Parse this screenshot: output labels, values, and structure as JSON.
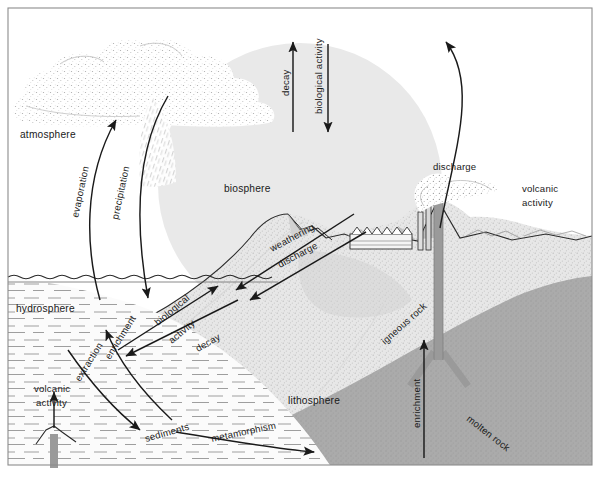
{
  "diagram": {
    "type": "scientific-schematic",
    "canvas": {
      "width": 600,
      "height": 479
    },
    "frame": {
      "stroke": "#8c8c8c",
      "inset_left": 8,
      "inset_top": 8,
      "inset_right": 8,
      "inset_bottom": 14
    }
  },
  "spheres": {
    "atmosphere": {
      "label": "atmosphere",
      "x": 20,
      "y": 134
    },
    "biosphere": {
      "label": "biosphere",
      "x": 223,
      "y": 188,
      "shape": "circle",
      "cx": 300,
      "cy": 185,
      "r": 142,
      "fill": "#e9e9e9"
    },
    "hydrosphere": {
      "label": "hydrosphere",
      "x": 16,
      "y": 308,
      "fill": "#f2f2f2"
    },
    "lithosphere": {
      "label": "lithosphere",
      "x": 290,
      "y": 401,
      "fill": "#e4e4e4"
    },
    "igneous_rock": {
      "label": "igneous rock",
      "x": 385,
      "y": 345,
      "rotate": -42
    },
    "molten_rock": {
      "label": "molten rock",
      "x": 470,
      "y": 425,
      "rotate": 38,
      "fill": "#a8a8a8"
    }
  },
  "flows": [
    {
      "name": "evaporation",
      "label": "evaporation",
      "x": 78,
      "y": 215,
      "rotate": -78,
      "direction": "up",
      "from": "hydrosphere",
      "to": "atmosphere"
    },
    {
      "name": "precipitation",
      "label": "precipitation",
      "x": 118,
      "y": 215,
      "rotate": -78,
      "direction": "down",
      "from": "atmosphere",
      "to": "hydrosphere"
    },
    {
      "name": "decay-biosphere",
      "label": "decay",
      "x": 287,
      "y": 90,
      "rotate": -90,
      "direction": "up",
      "from": "biosphere",
      "to": "atmosphere"
    },
    {
      "name": "biological-activity-biosphere",
      "label": "biological activity",
      "x": 320,
      "y": 90,
      "rotate": -90,
      "direction": "down",
      "from": "atmosphere",
      "to": "biosphere"
    },
    {
      "name": "weathering",
      "label": "weathering",
      "x": 276,
      "y": 250,
      "rotate": -26,
      "direction": "down-left",
      "from": "lithosphere",
      "to": "hydrosphere"
    },
    {
      "name": "discharge-land",
      "label": "discharge",
      "x": 282,
      "y": 264,
      "rotate": -26,
      "direction": "down-left",
      "from": "lithosphere",
      "to": "hydrosphere"
    },
    {
      "name": "discharge-volcanic",
      "label": "discharge",
      "x": 437,
      "y": 167,
      "direction": "up",
      "from": "lithosphere",
      "to": "atmosphere"
    },
    {
      "name": "volcanic-activity-land",
      "label": "volcanic activity",
      "x": 522,
      "y": 188,
      "direction": "up",
      "from": "molten rock",
      "to": "atmosphere"
    },
    {
      "name": "biological-activity-water",
      "label": "biological activity",
      "x": 163,
      "y": 320,
      "rotate": -42,
      "direction": "up-right",
      "from": "hydrosphere",
      "to": "biosphere"
    },
    {
      "name": "decay-water",
      "label": "decay",
      "x": 200,
      "y": 348,
      "rotate": -30,
      "direction": "down-left",
      "from": "biosphere",
      "to": "hydrosphere"
    },
    {
      "name": "enrichment-water",
      "label": "enrichment",
      "x": 115,
      "y": 358,
      "rotate": -58,
      "direction": "up-left",
      "from": "sediments",
      "to": "hydrosphere"
    },
    {
      "name": "extraction",
      "label": "extraction",
      "x": 88,
      "y": 378,
      "rotate": -58,
      "direction": "down-right",
      "from": "hydrosphere",
      "to": "sediments"
    },
    {
      "name": "volcanic-activity-seafloor",
      "label": "volcanic activity",
      "x": 36,
      "y": 389,
      "direction": "up",
      "from": "molten rock",
      "to": "hydrosphere"
    },
    {
      "name": "sediments",
      "label": "sediments",
      "x": 148,
      "y": 438,
      "rotate": -16
    },
    {
      "name": "metamorphism",
      "label": "metamorphism",
      "x": 213,
      "y": 439,
      "rotate": -14,
      "direction": "right",
      "from": "sediments",
      "to": "lithosphere"
    },
    {
      "name": "enrichment-magma",
      "label": "enrichment",
      "x": 424,
      "y": 425,
      "rotate": -90,
      "direction": "up",
      "from": "molten rock",
      "to": "igneous rock"
    }
  ],
  "scenery": {
    "cloud": "cumulus cloud mass, stippled",
    "rain": "diagonal rain streaks below cloud",
    "factory": "sawtooth-roof factory with two smokestacks",
    "mountain": "peaked mountain left of factory",
    "volcano": "cone volcano with vertical feeder conduit",
    "seafloor_vent": "submarine volcanic vent with conduit",
    "water_surface": "wavy sea surface line",
    "smoke_plume": "stippled smoke plume rising from stack"
  },
  "palette": {
    "ink": "#1a1a1a",
    "biosphere_fill": "#e9e9e9",
    "lithosphere_fill": "#e4e4e4",
    "hydrosphere_fill": "#f7f7f7",
    "molten_fill": "#a8a8a8",
    "conduit_fill": "#9a9a9a",
    "frame_stroke": "#8c8c8c"
  }
}
